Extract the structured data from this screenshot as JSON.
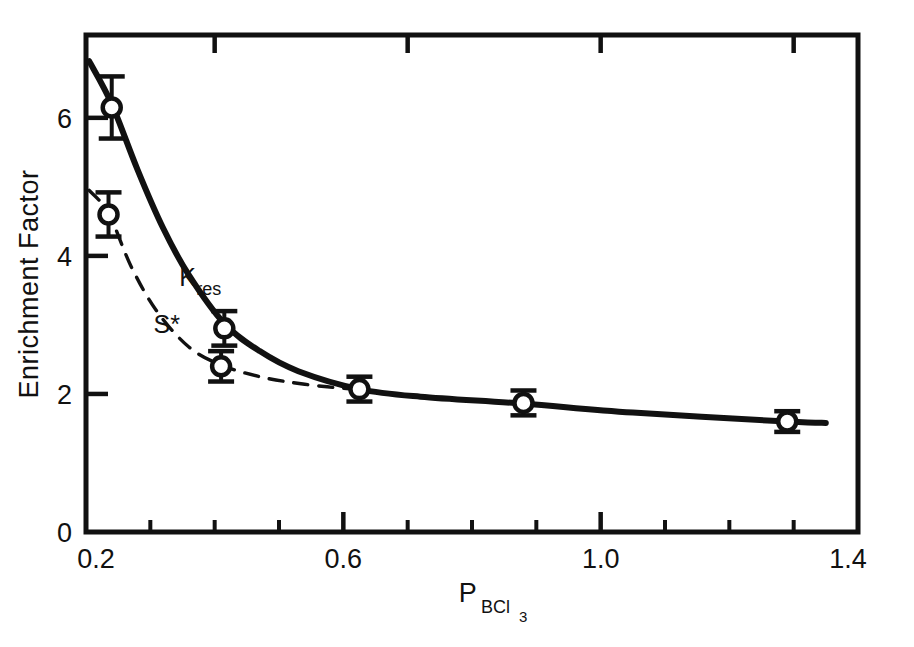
{
  "chart_data": {
    "type": "scatter",
    "title": "",
    "xlabel": "P_BCl3",
    "xlabel_base": "P",
    "xlabel_sub": "BCl",
    "xlabel_sub2": "3",
    "ylabel": "Enrichment Factor",
    "xlim": [
      0.2,
      1.4
    ],
    "ylim": [
      0,
      7.2
    ],
    "xticks": [
      0.2,
      0.6,
      1.0,
      1.4
    ],
    "xtick_labels": [
      "0.2",
      "0.6",
      "1.0",
      "1.4"
    ],
    "xminor_step": 0.1,
    "yticks": [
      0,
      2,
      4,
      6
    ],
    "ytick_labels": [
      "0",
      "2",
      "4",
      "6"
    ],
    "grid": false,
    "legend": "inline-annotations",
    "frame": "box",
    "series": [
      {
        "name": "K_res",
        "label": "K",
        "label_sub": "res",
        "label_x": 0.345,
        "label_y": 3.57,
        "linestyle": "solid",
        "marker": "open-circle",
        "points": [
          {
            "x": 0.24,
            "y": 6.15,
            "yerr": 0.45
          },
          {
            "x": 0.415,
            "y": 2.95,
            "yerr": 0.25
          },
          {
            "x": 0.625,
            "y": 2.07,
            "yerr": 0.18
          },
          {
            "x": 0.88,
            "y": 1.87,
            "yerr": 0.18
          },
          {
            "x": 1.29,
            "y": 1.6,
            "yerr": 0.15
          }
        ],
        "curve": [
          {
            "x": 0.205,
            "y": 6.82
          },
          {
            "x": 0.24,
            "y": 6.2
          },
          {
            "x": 0.28,
            "y": 5.25
          },
          {
            "x": 0.32,
            "y": 4.4
          },
          {
            "x": 0.36,
            "y": 3.72
          },
          {
            "x": 0.415,
            "y": 3.02
          },
          {
            "x": 0.47,
            "y": 2.62
          },
          {
            "x": 0.53,
            "y": 2.33
          },
          {
            "x": 0.625,
            "y": 2.07
          },
          {
            "x": 0.72,
            "y": 1.96
          },
          {
            "x": 0.88,
            "y": 1.86
          },
          {
            "x": 1.05,
            "y": 1.73
          },
          {
            "x": 1.29,
            "y": 1.6
          },
          {
            "x": 1.35,
            "y": 1.58
          }
        ]
      },
      {
        "name": "S*",
        "label": "S*",
        "label_x": 0.305,
        "label_y": 2.88,
        "linestyle": "dashed",
        "marker": "open-circle",
        "points": [
          {
            "x": 0.235,
            "y": 4.6,
            "yerr": 0.32
          },
          {
            "x": 0.41,
            "y": 2.4,
            "yerr": 0.22
          }
        ],
        "curve": [
          {
            "x": 0.205,
            "y": 4.95
          },
          {
            "x": 0.235,
            "y": 4.62
          },
          {
            "x": 0.27,
            "y": 3.85
          },
          {
            "x": 0.31,
            "y": 3.2
          },
          {
            "x": 0.36,
            "y": 2.68
          },
          {
            "x": 0.41,
            "y": 2.42
          },
          {
            "x": 0.47,
            "y": 2.25
          },
          {
            "x": 0.54,
            "y": 2.14
          },
          {
            "x": 0.625,
            "y": 2.06
          }
        ]
      }
    ],
    "colors": {
      "ink": "#111111",
      "background": "#ffffff",
      "marker_fill": "#ffffff"
    }
  }
}
